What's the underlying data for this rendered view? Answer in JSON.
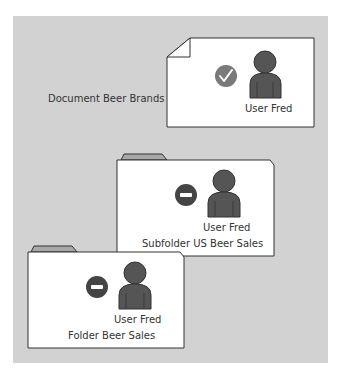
{
  "background_color": "#d2d2d2",
  "document": {
    "label": "Document Beer Brands",
    "user_label": "User Fred",
    "permission": "allow",
    "permission_icon": "check-circle-icon",
    "icon_color": "#7a7a7a"
  },
  "subfolder": {
    "label": "Subfolder US Beer Sales",
    "user_label": "User Fred",
    "permission": "deny",
    "permission_icon": "minus-circle-icon",
    "icon_color": "#444444"
  },
  "folder": {
    "label": "Folder Beer Sales",
    "user_label": "User Fred",
    "permission": "deny",
    "permission_icon": "minus-circle-icon",
    "icon_color": "#444444"
  },
  "colors": {
    "person": "#555555",
    "tab": "#a8a8a8",
    "outline": "#333333"
  }
}
